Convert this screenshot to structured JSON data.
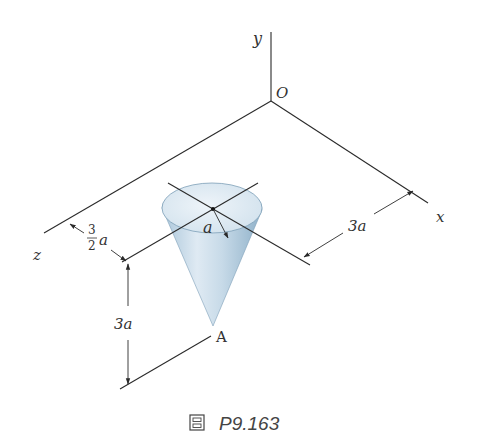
{
  "figure": {
    "caption_icon": "figure-glyph",
    "caption_text": "P9.163",
    "axes": {
      "x": "x",
      "y": "y",
      "z": "z",
      "origin": "O"
    },
    "point_labels": {
      "apex": "A"
    },
    "dimensions": {
      "radius": "a",
      "offset_z_num": "3",
      "offset_z_den": "2",
      "offset_z_var": "a",
      "offset_x": "3a",
      "height": "3a"
    },
    "colors": {
      "cone_light": "#e9f1f7",
      "cone_mid": "#c6dbe9",
      "cone_dark": "#8fb3cc",
      "line": "#2a2a2a"
    }
  }
}
